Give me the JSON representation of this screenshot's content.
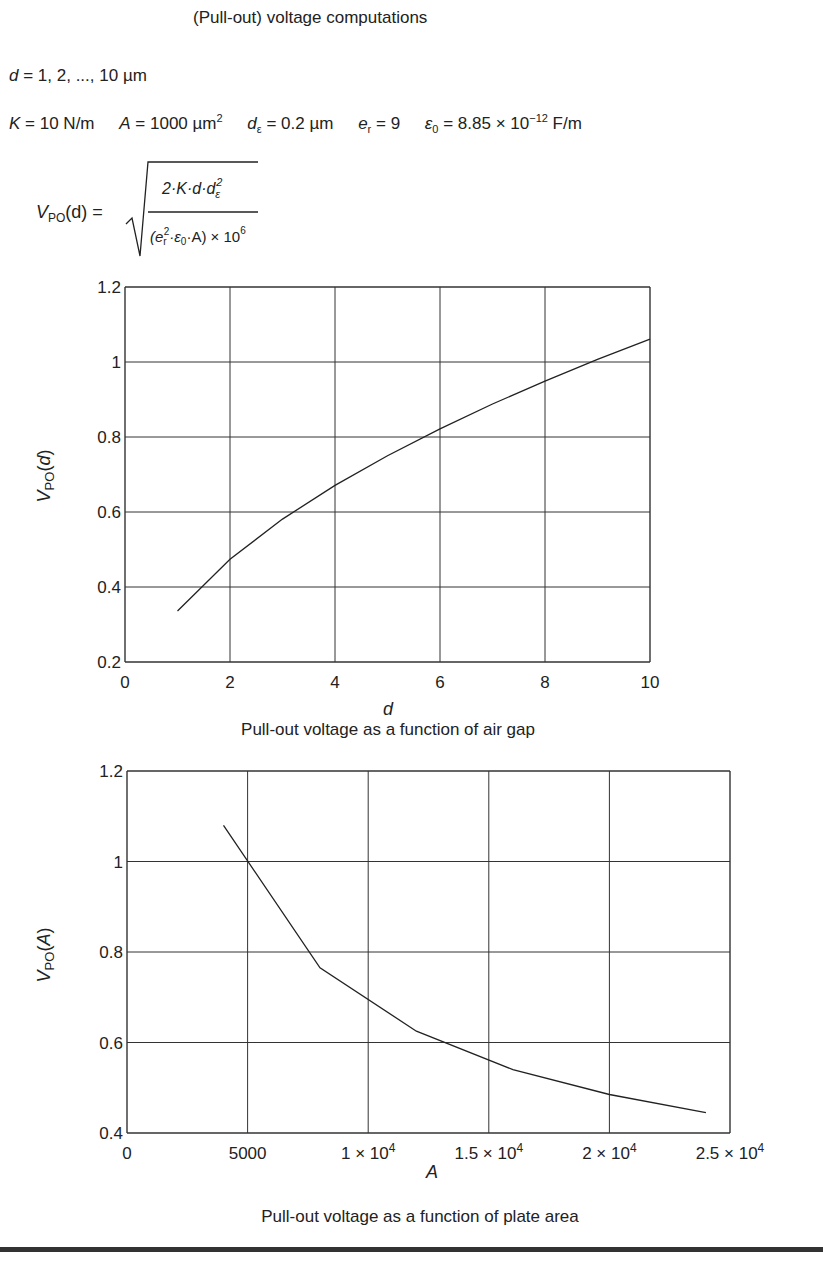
{
  "document": {
    "title": "(Pull-out) voltage computations",
    "range_line": {
      "var": "d",
      "text": " = 1, 2, ..., 10  µm"
    },
    "constants": [
      {
        "symbol": "K",
        "sub": "",
        "value": " = 10 N/m"
      },
      {
        "symbol": "A",
        "sub": "",
        "value": " = 1000 µm",
        "sup": "2"
      },
      {
        "symbol": "d",
        "sub": "ε",
        "value": " = 0.2 µm"
      },
      {
        "symbol": "e",
        "sub": "r",
        "value": " = 9"
      },
      {
        "symbol": "ε",
        "sub": "0",
        "value": " = 8.85 × 10",
        "sup": "−12",
        "tail": " F/m"
      }
    ],
    "formula": {
      "lhs": "V",
      "lhs_sub": "PO",
      "lhs_arg": "(d) =",
      "numerator": "2·K·d·d",
      "numerator_sub": "ε",
      "numerator_sup": "2",
      "denominator": "(e",
      "denominator_sub": "r",
      "denominator_sup": "2",
      "denominator_rest": "·ε",
      "denominator_rest_sub": "0",
      "denominator_tail": "·A) × 10",
      "denominator_exp": "6"
    }
  },
  "chart_data": [
    {
      "type": "line",
      "title": "Pull-out voltage as a function of air gap",
      "xlabel": "d",
      "ylabel": "V_PO(d)",
      "xlim": [
        0,
        10
      ],
      "ylim": [
        0.2,
        1.2
      ],
      "xticks": [
        "0",
        "2",
        "4",
        "6",
        "8",
        "10"
      ],
      "yticks": [
        "0.2",
        "0.4",
        "0.6",
        "0.8",
        "1",
        "1.2"
      ],
      "grid": true,
      "legend": null,
      "x": [
        1,
        2,
        3,
        4,
        5,
        6,
        7,
        8,
        9,
        10
      ],
      "series": [
        {
          "name": "V_PO(d)",
          "values": [
            0.336,
            0.474,
            0.581,
            0.671,
            0.75,
            0.822,
            0.888,
            0.949,
            1.007,
            1.061
          ]
        }
      ]
    },
    {
      "type": "line",
      "title": "Pull-out voltage as a function of plate area",
      "xlabel": "A",
      "ylabel": "V_PO(A)",
      "xlim": [
        0,
        25000
      ],
      "ylim": [
        0.4,
        1.2
      ],
      "xticks": [
        "0",
        "5000",
        "1 × 10⁴",
        "1.5 × 10⁴",
        "2 × 10⁴",
        "2.5 × 10⁴"
      ],
      "yticks": [
        "0.4",
        "0.6",
        "0.8",
        "1",
        "1.2"
      ],
      "grid": true,
      "legend": null,
      "x": [
        4000,
        8000,
        12000,
        16000,
        20000,
        24000
      ],
      "series": [
        {
          "name": "V_PO(A)",
          "values": [
            1.08,
            0.765,
            0.625,
            0.54,
            0.485,
            0.445
          ]
        }
      ]
    }
  ],
  "captions": {
    "chart1": "Pull-out voltage as a function of air gap",
    "chart2": "Pull-out voltage as a function of plate area"
  },
  "colors": {
    "ink": "#222222",
    "grid": "#333333",
    "background": "#ffffff"
  }
}
